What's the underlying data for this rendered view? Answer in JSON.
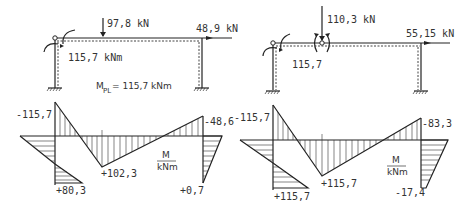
{
  "left_system": {
    "load_vertical": "97,8 kN",
    "load_horizontal": "48,9 kN",
    "hinge_moment": "115,7 kNm",
    "plastic_moment_symbol": "M",
    "plastic_moment_subscript": "PL",
    "plastic_moment_value": "= 115,7 kNm"
  },
  "right_system": {
    "load_vertical": "110,3 kN",
    "load_horizontal": "55,15 kN",
    "hinge_moment": "115,7"
  },
  "left_diagram": {
    "top_left": "-115,7",
    "bottom_left": "+80,3",
    "midspan": "+102,3",
    "top_right": "-48,6",
    "bottom_right": "+0,7",
    "unit_num": "M",
    "unit_den": "kNm"
  },
  "right_diagram": {
    "top_left": "-115,7",
    "bottom_left": "+115,7",
    "midspan": "+115,7",
    "top_right": "-83,3",
    "bottom_right": "-17,4",
    "unit_num": "M",
    "unit_den": "kNm"
  },
  "colors": {
    "ink": "#222222",
    "background": "#ffffff"
  }
}
